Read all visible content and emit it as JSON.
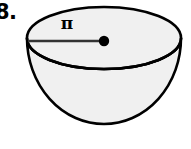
{
  "figure": {
    "problem_number": "8.",
    "shape_name": "hemisphere",
    "radius_label": "π",
    "colors": {
      "outline": "#000000",
      "fill": "#f0f0f0",
      "radius_line": "#333333",
      "center_dot": "#000000",
      "background": "#ffffff"
    },
    "geometry": {
      "rim_center_x": 104,
      "rim_center_y": 38,
      "rim_radius_x": 77,
      "rim_radius_y": 31,
      "center_dot_x": 104,
      "center_dot_y": 41,
      "center_dot_radius": 5,
      "radius_line_start_x": 28,
      "radius_line_start_y": 41,
      "bowl_bottom_y": 124
    }
  }
}
